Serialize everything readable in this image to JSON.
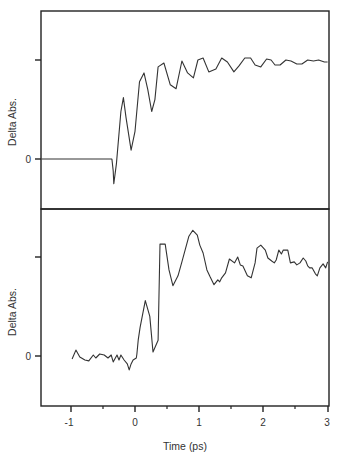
{
  "chart_data": [
    {
      "type": "line",
      "panel": "upper",
      "title": "",
      "xlabel": "",
      "ylabel": "Delta Abs.",
      "xlim": [
        -1.46,
        3.0
      ],
      "ylim": [
        -0.5,
        1.5
      ],
      "ytick_labels": [
        {
          "value": 0,
          "label": "0"
        },
        {
          "value": 1,
          "label": ""
        }
      ],
      "grid": false,
      "legend": null,
      "series": [
        {
          "name": "upper trace",
          "x": [
            -1.46,
            -0.36,
            -0.34,
            -0.33,
            -0.29,
            -0.22,
            -0.18,
            -0.14,
            -0.06,
            0.0,
            0.07,
            0.14,
            0.2,
            0.26,
            0.31,
            0.36,
            0.45,
            0.55,
            0.64,
            0.73,
            0.82,
            0.91,
            0.98,
            1.06,
            1.15,
            1.26,
            1.35,
            1.44,
            1.54,
            1.62,
            1.71,
            1.8,
            1.87,
            1.96,
            2.05,
            2.12,
            2.18,
            2.26,
            2.35,
            2.43,
            2.52,
            2.6,
            2.69,
            2.78,
            2.86,
            2.95,
            3.0
          ],
          "y": [
            0.0,
            0.0,
            -0.12,
            -0.25,
            -0.05,
            0.48,
            0.62,
            0.42,
            0.09,
            0.28,
            0.78,
            0.87,
            0.7,
            0.48,
            0.6,
            0.93,
            0.97,
            0.75,
            0.71,
            0.99,
            0.87,
            0.82,
            1.0,
            1.02,
            0.88,
            0.91,
            1.02,
            0.98,
            0.88,
            0.94,
            1.02,
            1.02,
            0.95,
            0.93,
            1.01,
            1.0,
            0.95,
            0.95,
            1.0,
            0.99,
            0.96,
            0.96,
            1.0,
            0.99,
            1.0,
            0.98,
            0.98
          ]
        }
      ]
    },
    {
      "type": "line",
      "panel": "lower",
      "title": "",
      "xlabel": "Time (ps)",
      "ylabel": "Delta Abs.",
      "xlim": [
        -1.46,
        3.0
      ],
      "ylim": [
        -0.5,
        1.5
      ],
      "xticks": [
        -1,
        0,
        1,
        2,
        3
      ],
      "xtick_labels": [
        "-1",
        "0",
        "1",
        "2",
        "3"
      ],
      "xminor_ticks": [
        -1.5,
        -0.5,
        0.5,
        1.5,
        2.5
      ],
      "ytick_labels": [
        {
          "value": 0,
          "label": "0"
        },
        {
          "value": 1,
          "label": ""
        }
      ],
      "grid": false,
      "legend": null,
      "series": [
        {
          "name": "lower trace",
          "x": [
            -0.98,
            -0.92,
            -0.86,
            -0.78,
            -0.72,
            -0.65,
            -0.61,
            -0.55,
            -0.48,
            -0.42,
            -0.37,
            -0.34,
            -0.28,
            -0.25,
            -0.22,
            -0.17,
            -0.12,
            -0.09,
            -0.06,
            -0.03,
            0.02,
            0.03,
            0.05,
            0.08,
            0.16,
            0.23,
            0.28,
            0.36,
            0.39,
            0.47,
            0.53,
            0.59,
            0.67,
            0.73,
            0.84,
            0.9,
            0.97,
            1.01,
            1.06,
            1.12,
            1.17,
            1.23,
            1.29,
            1.32,
            1.35,
            1.41,
            1.47,
            1.55,
            1.6,
            1.64,
            1.68,
            1.75,
            1.81,
            1.87,
            1.9,
            1.96,
            2.03,
            2.07,
            2.13,
            2.17,
            2.2,
            2.24,
            2.28,
            2.31,
            2.38,
            2.42,
            2.48,
            2.52,
            2.57,
            2.62,
            2.66,
            2.69,
            2.72,
            2.76,
            2.81,
            2.84,
            2.88,
            2.93,
            2.97,
            3.0
          ],
          "y": [
            -0.03,
            0.06,
            -0.01,
            -0.04,
            -0.05,
            0.01,
            -0.02,
            0.02,
            0.01,
            -0.02,
            0.01,
            -0.06,
            0.01,
            -0.04,
            0.01,
            -0.04,
            -0.08,
            -0.14,
            -0.08,
            -0.04,
            -0.02,
            0.02,
            0.16,
            0.29,
            0.56,
            0.4,
            0.04,
            0.16,
            1.13,
            1.13,
            0.87,
            0.71,
            0.81,
            0.95,
            1.21,
            1.27,
            1.22,
            1.12,
            1.04,
            0.87,
            0.8,
            0.72,
            0.77,
            0.75,
            0.79,
            0.84,
            0.98,
            0.94,
            1.0,
            0.92,
            0.91,
            0.81,
            0.79,
            0.94,
            1.09,
            1.12,
            1.07,
            0.99,
            0.96,
            0.94,
            0.97,
            1.07,
            1.03,
            1.07,
            1.07,
            0.94,
            0.95,
            0.92,
            0.94,
            0.99,
            0.96,
            0.91,
            0.89,
            0.89,
            0.83,
            0.81,
            0.89,
            0.93,
            0.89,
            0.95
          ]
        }
      ]
    }
  ],
  "axes": {
    "upper": {
      "ylabel": "Delta Abs.",
      "zero_label": "0"
    },
    "lower": {
      "ylabel": "Delta Abs.",
      "zero_label": "0"
    },
    "x": {
      "label": "Time (ps)",
      "tick_labels": [
        "-1",
        "0",
        "1",
        "2",
        "3"
      ]
    }
  },
  "colors": {
    "line": "#333333",
    "frame": "#222222",
    "background": "#ffffff"
  }
}
